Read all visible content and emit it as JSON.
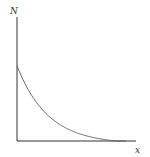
{
  "chart_data": {
    "type": "line",
    "title": "",
    "xlabel": "x",
    "ylabel": "N",
    "grid": false,
    "legend": null,
    "ticks": false,
    "series": [
      {
        "name": "N(x)",
        "x": [
          0,
          0.1,
          0.2,
          0.3,
          0.4,
          0.5,
          0.6,
          0.7,
          0.8,
          0.9,
          1.0
        ],
        "values": [
          1.0,
          0.74,
          0.55,
          0.4,
          0.29,
          0.2,
          0.13,
          0.08,
          0.04,
          0.01,
          0.0
        ]
      }
    ],
    "xlim": [
      0,
      1.2
    ],
    "ylim": [
      0,
      1.65
    ]
  },
  "colors": {
    "axis": "#333333",
    "curve": "#555555",
    "background": "#ffffff"
  }
}
